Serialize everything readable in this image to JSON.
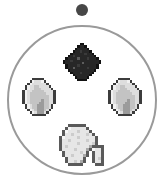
{
  "scene": {
    "title": "Radial Item Ring",
    "background_color": "#ffffff",
    "width": 165,
    "height": 191
  },
  "marker": {
    "name": "selection-dot",
    "label": "Selection dot",
    "color": "#474747",
    "center_x": 82,
    "center_y": 10,
    "radius": 6
  },
  "ring": {
    "name": "item-ring",
    "label": "Item ring",
    "stroke_color": "#9a9a9a",
    "stroke_width": 2,
    "center_x": 82,
    "center_y": 100,
    "radius": 75
  },
  "slots": [
    {
      "name": "slot-top",
      "position": "top",
      "item_label": "Coal",
      "icon": "coal-icon",
      "center_x": 82,
      "center_y": 62,
      "size": 38,
      "colors": {
        "outline": "#121212",
        "dark": "#272727",
        "mid": "#3a3a3a",
        "light": "#4d4d4d",
        "speck": "#5d5d5d"
      }
    },
    {
      "name": "slot-left",
      "position": "left",
      "item_label": "Pearl",
      "icon": "pearl-icon",
      "center_x": 39,
      "center_y": 97,
      "size": 38,
      "colors": {
        "outline": "#3c3c3c",
        "dark": "#9b9b9b",
        "mid": "#c3c3c3",
        "light": "#dddddd",
        "hilite": "#f1f1f1"
      }
    },
    {
      "name": "slot-right",
      "position": "right",
      "item_label": "Pearl",
      "icon": "pearl-icon",
      "center_x": 125,
      "center_y": 97,
      "size": 38,
      "colors": {
        "outline": "#3c3c3c",
        "dark": "#9b9b9b",
        "mid": "#c3c3c3",
        "light": "#dddddd",
        "hilite": "#f1f1f1"
      }
    },
    {
      "name": "slot-bottom",
      "position": "bottom",
      "item_label": "Gravel",
      "icon": "gravel-icon",
      "center_x": 80,
      "center_y": 145,
      "size": 48,
      "colors": {
        "outline": "#5a5a5a",
        "dark": "#a8a8a8",
        "mid": "#cccccc",
        "light": "#e6e6e6",
        "hilite": "#f7f7f7"
      }
    }
  ]
}
